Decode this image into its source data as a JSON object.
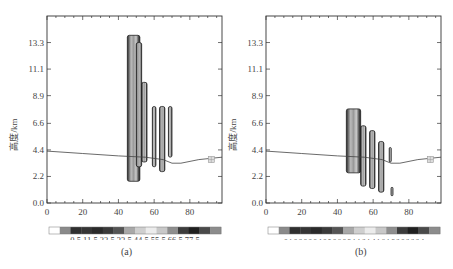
{
  "chart_data": [
    {
      "panel": "(a)",
      "type": "heatmap",
      "xlabel": "",
      "ylabel": "高度/km",
      "xticks": [
        0,
        20,
        40,
        60,
        80
      ],
      "yticks": [
        0.0,
        2.2,
        4.4,
        6.6,
        8.9,
        11.1,
        13.3
      ],
      "xlim": [
        0,
        98
      ],
      "ylim": [
        0,
        15.5
      ],
      "terrain_line": [
        [
          0,
          4.3
        ],
        [
          20,
          4.1
        ],
        [
          40,
          3.9
        ],
        [
          55,
          3.8
        ],
        [
          65,
          3.6
        ],
        [
          70,
          3.3
        ],
        [
          75,
          3.3
        ],
        [
          85,
          3.6
        ],
        [
          98,
          3.8
        ]
      ],
      "cells": [
        {
          "x0": 45,
          "x1": 52,
          "top": 13.9,
          "bottom": 1.8
        },
        {
          "x0": 50,
          "x1": 53,
          "top": 13.3,
          "bottom": 3.0
        },
        {
          "x0": 53,
          "x1": 56,
          "top": 10.0,
          "bottom": 3.4
        },
        {
          "x0": 59,
          "x1": 61,
          "top": 8.0,
          "bottom": 3.0
        },
        {
          "x0": 63,
          "x1": 66,
          "top": 8.0,
          "bottom": 2.6
        },
        {
          "x0": 68,
          "x1": 70,
          "top": 8.0,
          "bottom": 3.8
        }
      ],
      "marker": {
        "x": 92,
        "y": 3.6
      },
      "colorbar": {
        "labels": [
          "0.5",
          "1",
          "1.5",
          "2",
          "2.5",
          "3",
          "3.5",
          "4",
          "4.5",
          "5",
          "5.5",
          "6",
          "6.5",
          "7",
          "7.5"
        ],
        "label_text": "0.5 11.5 22.5 33.5 44.5 55.5 66.5 77.5",
        "colors": [
          "#ffffff",
          "#8a8a8a",
          "#2f2f2f",
          "#353535",
          "#2a2a2a",
          "#3a3a3a",
          "#555555",
          "#a8a8a8",
          "#cfcfcf",
          "#ececec",
          "#c8c8c8",
          "#8e8e8e",
          "#3c3c3c",
          "#1f1f1f",
          "#4a4a4a",
          "#8c8c8c"
        ]
      }
    },
    {
      "panel": "(b)",
      "type": "heatmap",
      "xlabel": "",
      "ylabel": "高度/km",
      "xticks": [
        0,
        20,
        40,
        60,
        80
      ],
      "yticks": [
        0.0,
        2.2,
        4.4,
        6.6,
        8.9,
        11.1,
        13.3
      ],
      "xlim": [
        0,
        98
      ],
      "ylim": [
        0,
        15.5
      ],
      "terrain_line": [
        [
          0,
          4.3
        ],
        [
          20,
          4.1
        ],
        [
          40,
          3.9
        ],
        [
          55,
          3.8
        ],
        [
          65,
          3.6
        ],
        [
          70,
          3.3
        ],
        [
          75,
          3.3
        ],
        [
          85,
          3.6
        ],
        [
          98,
          3.8
        ]
      ],
      "cells": [
        {
          "x0": 45,
          "x1": 53,
          "top": 7.8,
          "bottom": 2.5
        },
        {
          "x0": 53,
          "x1": 56,
          "top": 6.4,
          "bottom": 1.4
        },
        {
          "x0": 58,
          "x1": 61,
          "top": 6.0,
          "bottom": 1.2
        },
        {
          "x0": 63,
          "x1": 66,
          "top": 5.1,
          "bottom": 0.9
        },
        {
          "x0": 69,
          "x1": 70,
          "top": 4.6,
          "bottom": 3.4
        },
        {
          "x0": 70,
          "x1": 71,
          "top": 1.3,
          "bottom": 0.6
        }
      ],
      "marker": {
        "x": 92,
        "y": 3.6
      },
      "colorbar": {
        "labels": [
          "0.1",
          "0.2",
          "0.3",
          "0.4",
          "0.5",
          "0.6",
          "0.8",
          "1",
          "1.2",
          "1.4",
          "1.6",
          "1.8",
          "2.0",
          "2.2",
          "2.4"
        ],
        "label_text": "0.1 0.2 0.3 0.4 0.5 0.6 0.8  1  1.2 1.4 1.6 1.8 2.0 2.2 2.4",
        "colors": [
          "#ffffff",
          "#8a8a8a",
          "#2f2f2f",
          "#353535",
          "#2a2a2a",
          "#3a3a3a",
          "#555555",
          "#a8a8a8",
          "#cfcfcf",
          "#ececec",
          "#c8c8c8",
          "#8e8e8e",
          "#3c3c3c",
          "#1f1f1f",
          "#4a4a4a",
          "#8c8c8c"
        ]
      }
    }
  ],
  "captions": {
    "a": "(a)",
    "b": "(b)"
  },
  "axis": {
    "ylabel": "高度/km",
    "xtick_labels": [
      "0",
      "20",
      "40",
      "60",
      "80"
    ],
    "ytick_labels": [
      "0.0",
      "2.2",
      "4.4",
      "6.6",
      "8.9",
      "11.1",
      "13.3"
    ]
  }
}
